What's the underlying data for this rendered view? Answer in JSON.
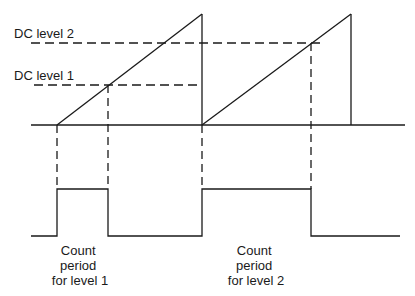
{
  "diagram": {
    "labels": {
      "dc_level_2": "DC level 2",
      "dc_level_1": "DC level 1"
    },
    "captions": {
      "level1": [
        "Count",
        "period",
        "for level 1"
      ],
      "level2": [
        "Count",
        "period",
        "for level 2"
      ]
    },
    "colors": {
      "line": "#1a1a1a",
      "background": "#ffffff"
    },
    "geometry": {
      "baseline_y": 125,
      "baseline_x": [
        31,
        405
      ],
      "ramp1": {
        "start": [
          57,
          125
        ],
        "peak": [
          202,
          14
        ]
      },
      "ramp2": {
        "start": [
          202,
          125
        ],
        "peak": [
          351,
          14
        ]
      },
      "dc_level_1_y": 85,
      "dc_level_2_y": 43,
      "dc1_intersect_x": 108,
      "dc2_intersect_x": 311,
      "pulse_high_y": 189,
      "pulse_low_y": 236,
      "pulse1_x": [
        57,
        108
      ],
      "pulse2_x": [
        202,
        311
      ]
    }
  }
}
